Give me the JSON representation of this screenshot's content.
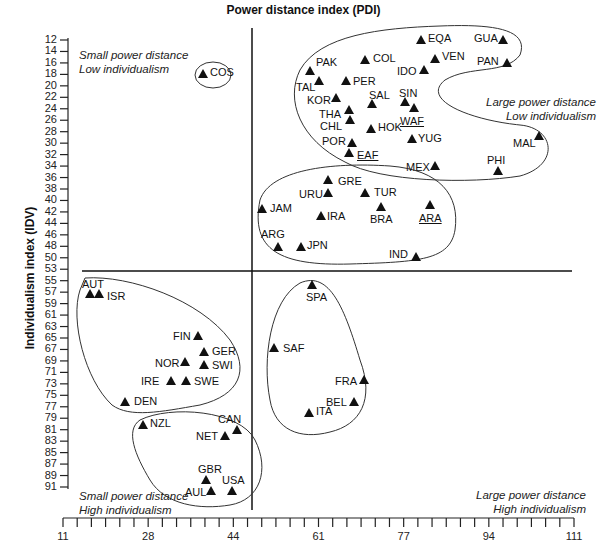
{
  "chart_data": {
    "type": "scatter",
    "title": "Power distance index (PDI)",
    "xlabel": "Power distance index (PDI)",
    "ylabel": "Individualism index (IDV)",
    "xlim": [
      11,
      111
    ],
    "ylim": [
      12,
      91
    ],
    "y_inverted": true,
    "x_ticks": [
      "11",
      "28",
      "44",
      "61",
      "77",
      "94",
      "111"
    ],
    "y_ticks": [
      "12",
      "14",
      "16",
      "18",
      "20",
      "22",
      "24",
      "26",
      "28",
      "30",
      "32",
      "34",
      "36",
      "38",
      "40",
      "42",
      "44",
      "46",
      "48",
      "50",
      "53",
      "55",
      "57",
      "59",
      "61",
      "63",
      "65",
      "67",
      "69",
      "71",
      "73",
      "75",
      "77",
      "79",
      "81",
      "83",
      "85",
      "87",
      "89",
      "91"
    ],
    "dividers": {
      "x": 44,
      "y": 50
    },
    "quadrant_labels": [
      {
        "position": "top-left",
        "line1": "Small power distance",
        "line2": "Low individualism"
      },
      {
        "position": "top-right",
        "line1": "Large power distance",
        "line2": "Low individualism"
      },
      {
        "position": "bottom-left",
        "line1": "Small power distance",
        "line2": "High individualism"
      },
      {
        "position": "bottom-right",
        "line1": "Large power distance",
        "line2": "High individualism"
      }
    ],
    "points": [
      {
        "label": "COS",
        "x": 35,
        "y": 15,
        "px": 203,
        "py": 74,
        "lx": 210,
        "ly": 68
      },
      {
        "label": "PAK",
        "x": 55,
        "y": 14,
        "px": 310,
        "py": 71,
        "lx": 316,
        "ly": 58
      },
      {
        "label": "COL",
        "x": 67,
        "y": 13,
        "px": 365,
        "py": 60,
        "lx": 373,
        "ly": 54
      },
      {
        "label": "EQA",
        "x": 78,
        "y": 8,
        "px": 421,
        "py": 40,
        "lx": 428,
        "ly": 34
      },
      {
        "label": "GUA",
        "x": 95,
        "y": 6,
        "px": 503,
        "py": 40,
        "lx": 474,
        "ly": 34
      },
      {
        "label": "VEN",
        "x": 81,
        "y": 12,
        "px": 435,
        "py": 59,
        "lx": 442,
        "ly": 52
      },
      {
        "label": "PAN",
        "x": 95,
        "y": 11,
        "px": 507,
        "py": 63,
        "lx": 477,
        "ly": 57
      },
      {
        "label": "IDO",
        "x": 78,
        "y": 14,
        "px": 424,
        "py": 70,
        "lx": 397,
        "ly": 67
      },
      {
        "label": "TAL",
        "x": 58,
        "y": 17,
        "px": 319,
        "py": 81,
        "lx": 296,
        "ly": 83
      },
      {
        "label": "PER",
        "x": 64,
        "y": 16,
        "px": 346,
        "py": 81,
        "lx": 353,
        "ly": 77
      },
      {
        "label": "KOR",
        "x": 60,
        "y": 18,
        "px": 336,
        "py": 98,
        "lx": 307,
        "ly": 96
      },
      {
        "label": "SAL",
        "x": 66,
        "y": 19,
        "px": 372,
        "py": 104,
        "lx": 369,
        "ly": 91
      },
      {
        "label": "SIN",
        "x": 74,
        "y": 20,
        "px": 405,
        "py": 102,
        "lx": 399,
        "ly": 89
      },
      {
        "label": "THA",
        "x": 64,
        "y": 20,
        "px": 349,
        "py": 110,
        "lx": 319,
        "ly": 110
      },
      {
        "label": "WAF",
        "x": 77,
        "y": 20,
        "px": 414,
        "py": 108,
        "lx": 400,
        "ly": 117,
        "underline": true
      },
      {
        "label": "CHL",
        "x": 63,
        "y": 23,
        "px": 350,
        "py": 120,
        "lx": 320,
        "ly": 122
      },
      {
        "label": "HOK",
        "x": 68,
        "y": 25,
        "px": 371,
        "py": 129,
        "lx": 378,
        "ly": 123
      },
      {
        "label": "POR",
        "x": 63,
        "y": 27,
        "px": 352,
        "py": 143,
        "lx": 322,
        "ly": 137
      },
      {
        "label": "YUG",
        "x": 76,
        "y": 27,
        "px": 412,
        "py": 139,
        "lx": 418,
        "ly": 134
      },
      {
        "label": "MAL",
        "x": 104,
        "y": 26,
        "px": 539,
        "py": 136,
        "lx": 513,
        "ly": 139
      },
      {
        "label": "EAF",
        "x": 64,
        "y": 27,
        "px": 349,
        "py": 153,
        "lx": 357,
        "ly": 151,
        "underline": true
      },
      {
        "label": "MEX",
        "x": 81,
        "y": 30,
        "px": 435,
        "py": 166,
        "lx": 406,
        "ly": 163
      },
      {
        "label": "PHI",
        "x": 94,
        "y": 32,
        "px": 498,
        "py": 171,
        "lx": 487,
        "ly": 156
      },
      {
        "label": "GRE",
        "x": 60,
        "y": 35,
        "px": 328,
        "py": 180,
        "lx": 338,
        "ly": 177
      },
      {
        "label": "URU",
        "x": 61,
        "y": 36,
        "px": 328,
        "py": 193,
        "lx": 299,
        "ly": 190
      },
      {
        "label": "TUR",
        "x": 66,
        "y": 37,
        "px": 365,
        "py": 193,
        "lx": 374,
        "ly": 188
      },
      {
        "label": "JAM",
        "x": 45,
        "y": 39,
        "px": 262,
        "py": 209,
        "lx": 270,
        "ly": 204
      },
      {
        "label": "BRA",
        "x": 69,
        "y": 38,
        "px": 381,
        "py": 207,
        "lx": 370,
        "ly": 215
      },
      {
        "label": "ARA",
        "x": 80,
        "y": 38,
        "px": 430,
        "py": 205,
        "lx": 419,
        "ly": 214,
        "underline": true
      },
      {
        "label": "IRA",
        "x": 58,
        "y": 41,
        "px": 321,
        "py": 216,
        "lx": 327,
        "ly": 212
      },
      {
        "label": "ARG",
        "x": 49,
        "y": 46,
        "px": 278,
        "py": 247,
        "lx": 261,
        "ly": 230
      },
      {
        "label": "JPN",
        "x": 54,
        "y": 46,
        "px": 301,
        "py": 247,
        "lx": 307,
        "ly": 241
      },
      {
        "label": "IND",
        "x": 77,
        "y": 48,
        "px": 416,
        "py": 257,
        "lx": 389,
        "ly": 250
      },
      {
        "label": "AUT",
        "x": 11,
        "y": 55,
        "px": 90,
        "py": 294,
        "lx": 82,
        "ly": 280
      },
      {
        "label": "ISR",
        "x": 13,
        "y": 54,
        "px": 99,
        "py": 294,
        "lx": 107,
        "ly": 292
      },
      {
        "label": "SPA",
        "x": 57,
        "y": 51,
        "px": 312,
        "py": 285,
        "lx": 306,
        "ly": 293
      },
      {
        "label": "FIN",
        "x": 33,
        "y": 63,
        "px": 198,
        "py": 336,
        "lx": 173,
        "ly": 332
      },
      {
        "label": "GER",
        "x": 35,
        "y": 67,
        "px": 204,
        "py": 352,
        "lx": 212,
        "ly": 347
      },
      {
        "label": "NOR",
        "x": 31,
        "y": 69,
        "px": 185,
        "py": 362,
        "lx": 155,
        "ly": 359
      },
      {
        "label": "SWI",
        "x": 34,
        "y": 68,
        "px": 204,
        "py": 365,
        "lx": 212,
        "ly": 361
      },
      {
        "label": "SAF",
        "x": 49,
        "y": 65,
        "px": 274,
        "py": 348,
        "lx": 283,
        "ly": 344
      },
      {
        "label": "IRE",
        "x": 28,
        "y": 70,
        "px": 171,
        "py": 381,
        "lx": 141,
        "ly": 377
      },
      {
        "label": "SWE",
        "x": 31,
        "y": 71,
        "px": 186,
        "py": 381,
        "lx": 194,
        "ly": 377
      },
      {
        "label": "FRA",
        "x": 68,
        "y": 71,
        "px": 364,
        "py": 380,
        "lx": 335,
        "ly": 377
      },
      {
        "label": "BEL",
        "x": 65,
        "y": 75,
        "px": 354,
        "py": 402,
        "lx": 326,
        "ly": 398
      },
      {
        "label": "DEN",
        "x": 18,
        "y": 74,
        "px": 125,
        "py": 402,
        "lx": 134,
        "ly": 397
      },
      {
        "label": "ITA",
        "x": 50,
        "y": 76,
        "px": 309,
        "py": 413,
        "lx": 316,
        "ly": 407
      },
      {
        "label": "NZL",
        "x": 22,
        "y": 79,
        "px": 143,
        "py": 425,
        "lx": 150,
        "ly": 419
      },
      {
        "label": "CAN",
        "x": 39,
        "y": 80,
        "px": 237,
        "py": 430,
        "lx": 218,
        "ly": 415
      },
      {
        "label": "NET",
        "x": 38,
        "y": 80,
        "px": 225,
        "py": 436,
        "lx": 196,
        "ly": 432
      },
      {
        "label": "GBR",
        "x": 35,
        "y": 89,
        "px": 206,
        "py": 480,
        "lx": 198,
        "ly": 465
      },
      {
        "label": "AUL",
        "x": 36,
        "y": 90,
        "px": 211,
        "py": 491,
        "lx": 185,
        "ly": 488
      },
      {
        "label": "USA",
        "x": 40,
        "y": 91,
        "px": 232,
        "py": 491,
        "lx": 222,
        "ly": 476
      }
    ]
  }
}
